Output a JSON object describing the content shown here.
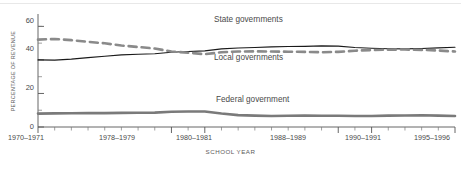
{
  "chart_data": {
    "type": "line",
    "title": "",
    "xlabel": "SCHOOL YEAR",
    "ylabel": "PERCENTAGE OF REVENUE",
    "ylim": [
      0,
      65
    ],
    "yticks": [
      0,
      20,
      40,
      60
    ],
    "grid": false,
    "legend_position": "inline-annotations",
    "categories": [
      "1970–1971",
      "1971–1972",
      "1972–1973",
      "1973–1974",
      "1974–1975",
      "1975–1976",
      "1976–1977",
      "1977–1978",
      "1978–1979",
      "1979–1980",
      "1980–1981",
      "1981–1982",
      "1982–1983",
      "1983–1984",
      "1984–1985",
      "1985–1986",
      "1986–1987",
      "1987–1988",
      "1988–1989",
      "1989–1990",
      "1990–1991",
      "1991–1992",
      "1992–1993",
      "1993–1994",
      "1994–1995",
      "1995–1996"
    ],
    "xtick_labels": [
      "1970–1971",
      "1978–1979",
      "1980–1981",
      "1988–1989",
      "1990–1991",
      "1995–1996"
    ],
    "xtick_indices": [
      0,
      8,
      10,
      18,
      20,
      25
    ],
    "series": [
      {
        "name": "State governments",
        "style": "solid",
        "color": "#1a1a1a",
        "values": [
          40.0,
          39.9,
          40.5,
          41.4,
          42.2,
          43.0,
          43.4,
          43.7,
          44.6,
          45.0,
          45.4,
          46.6,
          47.1,
          47.4,
          47.8,
          48.0,
          48.1,
          48.4,
          48.2,
          47.4,
          47.0,
          46.7,
          46.6,
          46.8,
          47.2,
          47.6
        ]
      },
      {
        "name": "Local governments",
        "style": "dashed",
        "color": "#8a8a8a",
        "values": [
          52.1,
          52.5,
          51.8,
          50.8,
          49.9,
          48.6,
          47.7,
          46.8,
          45.0,
          44.3,
          43.4,
          44.6,
          45.0,
          45.1,
          45.0,
          44.9,
          44.8,
          44.6,
          44.8,
          45.5,
          45.9,
          46.1,
          46.2,
          46.0,
          45.6,
          45.0
        ]
      },
      {
        "name": "Federal government",
        "style": "solid-thick",
        "color": "#7a7a7a",
        "values": [
          8.0,
          8.1,
          8.2,
          8.3,
          8.3,
          8.4,
          8.5,
          8.6,
          9.1,
          9.2,
          9.2,
          8.0,
          7.1,
          6.8,
          6.6,
          6.7,
          6.8,
          6.7,
          6.7,
          6.6,
          6.6,
          6.8,
          6.9,
          7.0,
          6.8,
          6.6
        ]
      }
    ],
    "annotations": [
      {
        "text": "State governments",
        "x_index": 13,
        "y": 56
      },
      {
        "text": "Local governments",
        "x_index": 13,
        "y": 38
      },
      {
        "text": "Federal government",
        "x_index": 14,
        "y": 16
      }
    ]
  }
}
